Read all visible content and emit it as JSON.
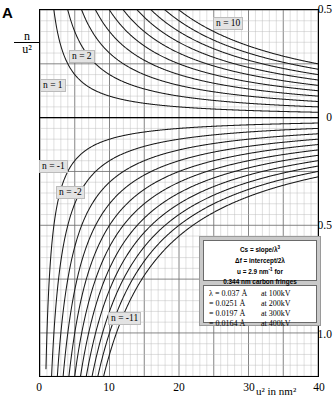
{
  "panel_label": "A",
  "axes": {
    "y_title_num": "n",
    "y_title_den": "u²",
    "x_title": "u² in nm²",
    "y_ticks": [
      "0.5",
      "0",
      "-0.5",
      "-1.0"
    ],
    "y_tick_values": [
      0.5,
      0,
      -0.5,
      -1.0
    ],
    "x_ticks": [
      "0",
      "10",
      "20",
      "30",
      "40"
    ],
    "x_tick_values": [
      0,
      10,
      20,
      30,
      40
    ]
  },
  "curve_labels": [
    {
      "text": "n = 10",
      "x": 213,
      "y": 17
    },
    {
      "text": "n = 2",
      "x": 69,
      "y": 50
    },
    {
      "text": "n = 1",
      "x": 40,
      "y": 79
    },
    {
      "text": "n = -1",
      "x": 39,
      "y": 160
    },
    {
      "text": "n = -2",
      "x": 56,
      "y": 186
    },
    {
      "text": "n = -11",
      "x": 108,
      "y": 312
    }
  ],
  "legend": {
    "line1_a": "Cs = slope/",
    "line1_b": "λ",
    "line1_c": "3",
    "line2": "Δf = intercept/2λ",
    "line3_a": "u = 2.9 nm",
    "line3_b": "-1",
    "line3_c": " for",
    "line4": "0.344 nm carbon fringes",
    "wavelengths": [
      {
        "sym": "λ = 0.037 Å",
        "volt": "at 100kV"
      },
      {
        "sym": "= 0.0251 Å",
        "volt": "at 200kV"
      },
      {
        "sym": "= 0.0197 Å",
        "volt": "at 300kV"
      },
      {
        "sym": "= 0.0164 Å",
        "volt": "at 400kV"
      }
    ]
  },
  "chart_data": {
    "type": "line",
    "title": "",
    "xlabel": "u² in nm²",
    "ylabel": "n/u²",
    "xlim": [
      0,
      40
    ],
    "ylim": [
      -1.2,
      0.5
    ],
    "grid": true,
    "legend_position": "inside-lower-right",
    "series": [
      {
        "name": "n = 1",
        "n": 1,
        "formula": "y = 1/x"
      },
      {
        "name": "n = 2",
        "n": 2,
        "formula": "y = 2/x"
      },
      {
        "name": "n = 3",
        "n": 3,
        "formula": "y = 3/x"
      },
      {
        "name": "n = 4",
        "n": 4,
        "formula": "y = 4/x"
      },
      {
        "name": "n = 5",
        "n": 5,
        "formula": "y = 5/x"
      },
      {
        "name": "n = 6",
        "n": 6,
        "formula": "y = 6/x"
      },
      {
        "name": "n = 7",
        "n": 7,
        "formula": "y = 7/x"
      },
      {
        "name": "n = 8",
        "n": 8,
        "formula": "y = 8/x"
      },
      {
        "name": "n = 9",
        "n": 9,
        "formula": "y = 9/x"
      },
      {
        "name": "n = 10",
        "n": 10,
        "formula": "y = 10/x"
      },
      {
        "name": "n = -1",
        "n": -1,
        "formula": "y = -1/x"
      },
      {
        "name": "n = -2",
        "n": -2,
        "formula": "y = -2/x"
      },
      {
        "name": "n = -3",
        "n": -3,
        "formula": "y = -3/x"
      },
      {
        "name": "n = -4",
        "n": -4,
        "formula": "y = -4/x"
      },
      {
        "name": "n = -5",
        "n": -5,
        "formula": "y = -5/x"
      },
      {
        "name": "n = -6",
        "n": -6,
        "formula": "y = -6/x"
      },
      {
        "name": "n = -7",
        "n": -7,
        "formula": "y = -7/x"
      },
      {
        "name": "n = -8",
        "n": -8,
        "formula": "y = -8/x"
      },
      {
        "name": "n = -9",
        "n": -9,
        "formula": "y = -9/x"
      },
      {
        "name": "n = -10",
        "n": -10,
        "formula": "y = -10/x"
      },
      {
        "name": "n = -11",
        "n": -11,
        "formula": "y = -11/x"
      }
    ],
    "annotations": [
      "Cs = slope/λ³",
      "Δf = intercept/2λ",
      "u = 2.9 nm-1 for 0.344 nm carbon fringes",
      "λ = 0.037 Å at 100kV",
      "λ = 0.0251 Å at 200kV",
      "λ = 0.0197 Å at 300kV",
      "λ = 0.0164 Å at 400kV"
    ]
  },
  "colors": {
    "curve": "#1a1a1a",
    "grid_minor": "#b8b8b8",
    "grid_major": "#6f6f6f",
    "axis": "#000000",
    "legend_bg": "#c9c9c9",
    "label_bg": "#e3e3e3"
  }
}
